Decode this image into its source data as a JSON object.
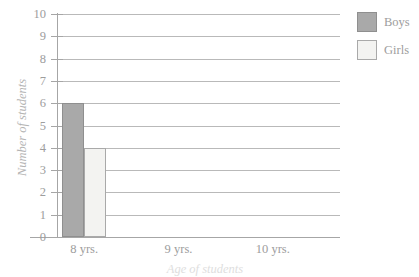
{
  "chart_data": {
    "type": "bar",
    "title": "",
    "xlabel": "Age of students",
    "ylabel": "Number of students",
    "categories": [
      "8 yrs.",
      "9 yrs.",
      "10 yrs."
    ],
    "series": [
      {
        "name": "Boys",
        "color": "#a9a9a9",
        "values": [
          6,
          0,
          0
        ]
      },
      {
        "name": "Girls",
        "color": "#f3f3f1",
        "values": [
          4,
          0,
          0
        ]
      }
    ],
    "ylim": [
      0,
      10
    ],
    "ytick_labels": [
      "0",
      "1",
      "2",
      "3",
      "4",
      "5",
      "6",
      "7",
      "8",
      "9",
      "10"
    ],
    "grid": true,
    "legend_position": "top-right"
  },
  "legend": {
    "entries": [
      {
        "label": "Boys",
        "swatch": "boys-swatch"
      },
      {
        "label": "Girls",
        "swatch": "girls-swatch"
      }
    ]
  }
}
